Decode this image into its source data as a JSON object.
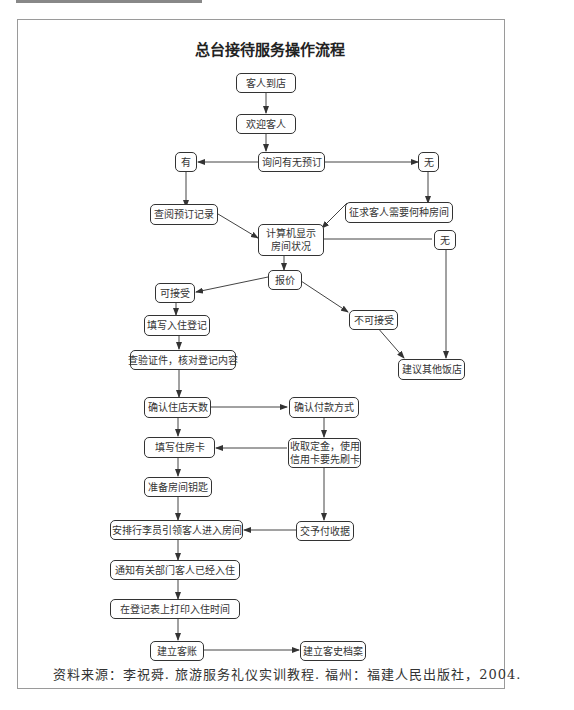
{
  "title": "总台接待服务操作流程",
  "nodes": {
    "arrive": "客人到店",
    "welcome": "欢迎客人",
    "ask_reservation": "询问有无预订",
    "has": "有",
    "none1": "无",
    "check_records": "查阅预订记录",
    "ask_room_type": "征求客人需要何种房间",
    "computer_line1": "计算机显示",
    "computer_line2": "房间状况",
    "none2": "无",
    "quote": "报价",
    "acceptable": "可接受",
    "not_acceptable": "不可接受",
    "suggest_other_hotel": "建议其他饭店",
    "fill_registration": "填写入住登记",
    "verify_id": "查验证件，核对登记内容",
    "confirm_days": "确认住店天数",
    "confirm_payment": "确认付款方式",
    "fill_room_card": "填写住房卡",
    "deposit_line1": "收取定金，使用",
    "deposit_line2": "信用卡要先刷卡",
    "prepare_key": "准备房间钥匙",
    "give_receipt": "交予付收据",
    "bellboy": "安排行李员引领客人进入房间",
    "notify": "通知有关部门客人已经入住",
    "print_time": "在登记表上打印入住时间",
    "open_account": "建立客账",
    "guest_history": "建立客史档案"
  },
  "edges": [
    [
      "客人到店",
      "欢迎客人"
    ],
    [
      "欢迎客人",
      "询问有无预订"
    ],
    [
      "询问有无预订",
      "有"
    ],
    [
      "询问有无预订",
      "无"
    ],
    [
      "有",
      "查阅预订记录"
    ],
    [
      "无",
      "征求客人需要何种房间"
    ],
    [
      "查阅预订记录",
      "计算机显示房间状况"
    ],
    [
      "征求客人需要何种房间",
      "计算机显示房间状况"
    ],
    [
      "计算机显示房间状况",
      "无"
    ],
    [
      "计算机显示房间状况",
      "报价"
    ],
    [
      "无",
      "建议其他饭店"
    ],
    [
      "报价",
      "可接受"
    ],
    [
      "报价",
      "不可接受"
    ],
    [
      "不可接受",
      "建议其他饭店"
    ],
    [
      "可接受",
      "填写入住登记"
    ],
    [
      "填写入住登记",
      "查验证件，核对登记内容"
    ],
    [
      "查验证件，核对登记内容",
      "确认住店天数"
    ],
    [
      "确认住店天数",
      "确认付款方式"
    ],
    [
      "确认住店天数",
      "填写住房卡"
    ],
    [
      "确认付款方式",
      "收取定金，使用信用卡要先刷卡"
    ],
    [
      "收取定金，使用信用卡要先刷卡",
      "填写住房卡"
    ],
    [
      "收取定金，使用信用卡要先刷卡",
      "交予付收据"
    ],
    [
      "填写住房卡",
      "准备房间钥匙"
    ],
    [
      "准备房间钥匙",
      "安排行李员引领客人进入房间"
    ],
    [
      "交予付收据",
      "安排行李员引领客人进入房间"
    ],
    [
      "安排行李员引领客人进入房间",
      "通知有关部门客人已经入住"
    ],
    [
      "通知有关部门客人已经入住",
      "在登记表上打印入住时间"
    ],
    [
      "在登记表上打印入住时间",
      "建立客账"
    ],
    [
      "建立客账",
      "建立客史档案"
    ]
  ],
  "source": "资料来源：李祝舜. 旅游服务礼仪实训教程. 福州：福建人民出版社，2004."
}
